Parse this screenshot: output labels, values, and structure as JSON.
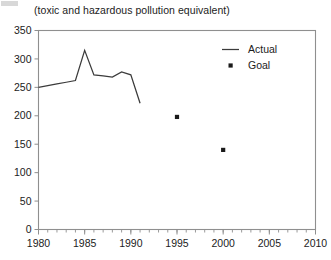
{
  "chart_data": {
    "type": "line",
    "title": "",
    "subtitle": "(toxic and hazardous pollution equivalent)",
    "xlabel": "",
    "ylabel": "",
    "xlim": [
      1980,
      2010
    ],
    "ylim": [
      0,
      350
    ],
    "grid": false,
    "legend_position": "top-right",
    "x_ticks": [
      1980,
      1985,
      1990,
      1995,
      2000,
      2005,
      2010
    ],
    "x_tick_labels": [
      "1980",
      "1985",
      "1990",
      "1995",
      "2000",
      "2005",
      "2010"
    ],
    "x_minor_tick_step": 1,
    "y_ticks": [
      0,
      50,
      100,
      150,
      200,
      250,
      300,
      350
    ],
    "y_tick_labels": [
      "0",
      "50",
      "100",
      "150",
      "200",
      "250",
      "300",
      "350"
    ],
    "series": [
      {
        "name": "Actual",
        "type": "line",
        "marker": "none",
        "color": "#3b3b3b",
        "x": [
          1980,
          1981,
          1982,
          1983,
          1984,
          1985,
          1986,
          1987,
          1988,
          1989,
          1990,
          1991
        ],
        "values": [
          250,
          253,
          256,
          259,
          262,
          315,
          272,
          270,
          268,
          277,
          272,
          222
        ]
      },
      {
        "name": "Goal",
        "type": "scatter",
        "marker": "square-dot",
        "color": "#1a1a1a",
        "x": [
          1995,
          2000
        ],
        "values": [
          198,
          140
        ]
      }
    ],
    "legend": [
      {
        "label": "Actual",
        "marker": "line",
        "color": "#3b3b3b"
      },
      {
        "label": "Goal",
        "marker": "dot",
        "color": "#1a1a1a"
      }
    ]
  },
  "colors": {
    "axis": "#8f8f8f",
    "text": "#1c1c1c",
    "actual": "#3b3b3b",
    "goal": "#1a1a1a",
    "background": "#ffffff"
  }
}
